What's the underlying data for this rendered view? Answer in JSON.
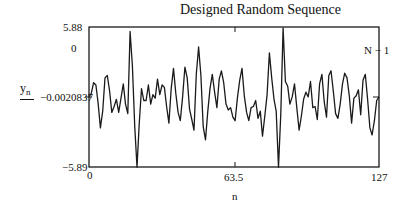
{
  "chart_data": {
    "type": "line",
    "title": "Designed Random Sequence",
    "xlabel": "n",
    "ylabel": "y_n",
    "xlim": [
      0,
      127
    ],
    "ylim": [
      -5.89,
      5.88
    ],
    "x_ticks": [
      "0",
      "63.5",
      "127"
    ],
    "y_ticks": [
      "5.88",
      "0",
      "-5.89"
    ],
    "annotations": {
      "y_marker_label": "-0.0020837",
      "y_marker_value": -0.0020837,
      "right_marker_label": "N - 1",
      "right_marker_value": 127
    },
    "grid": false,
    "legend": null,
    "series": [
      {
        "name": "y_n",
        "x": [
          0,
          1,
          2,
          3,
          4,
          5,
          6,
          7,
          8,
          9,
          10,
          11,
          12,
          13,
          14,
          15,
          16,
          17,
          18,
          19,
          20,
          21,
          22,
          23,
          24,
          25,
          26,
          27,
          28,
          29,
          30,
          31,
          32,
          33,
          34,
          35,
          36,
          37,
          38,
          39,
          40,
          41,
          42,
          43,
          44,
          45,
          46,
          47,
          48,
          49,
          50,
          51,
          52,
          53,
          54,
          55,
          56,
          57,
          58,
          59,
          60,
          61,
          62,
          63,
          64,
          65,
          66,
          67,
          68,
          69,
          70,
          71,
          72,
          73,
          74,
          75,
          76,
          77,
          78,
          79,
          80,
          81,
          82,
          83,
          84,
          85,
          86,
          87,
          88,
          89,
          90,
          91,
          92,
          93,
          94,
          95,
          96,
          97,
          98,
          99,
          100,
          101,
          102,
          103,
          104,
          105,
          106,
          107,
          108,
          109,
          110,
          111,
          112,
          113,
          114,
          115,
          116,
          117,
          118,
          119,
          120,
          121,
          122,
          123,
          124,
          125,
          126,
          127
        ],
        "values": [
          0.0,
          0.3,
          1.2,
          1.0,
          -0.5,
          -2.6,
          -1.2,
          1.6,
          1.8,
          0.5,
          -1.3,
          -0.8,
          -0.2,
          -1.3,
          -0.1,
          1.1,
          -0.6,
          -1.4,
          5.5,
          2.6,
          -2.4,
          -5.9,
          -2.3,
          0.7,
          -0.3,
          -0.3,
          1.0,
          -0.6,
          0.2,
          -0.1,
          1.5,
          0.2,
          1.0,
          0.8,
          -0.8,
          -2.2,
          0.7,
          2.4,
          0.3,
          -1.3,
          -2.0,
          0.0,
          2.5,
          1.6,
          -1.0,
          -1.9,
          -2.8,
          1.9,
          4.2,
          1.8,
          -2.5,
          -3.6,
          -1.3,
          0.7,
          1.9,
          0.4,
          -0.9,
          1.5,
          2.2,
          1.2,
          -0.6,
          -1.1,
          -0.9,
          -1.7,
          -2.0,
          -0.1,
          1.4,
          2.4,
          0.1,
          -1.3,
          -2.0,
          -0.9,
          -0.8,
          -0.3,
          -1.8,
          -1.2,
          -3.3,
          -1.6,
          0.2,
          3.7,
          1.6,
          -0.2,
          -1.2,
          -5.9,
          -1.4,
          5.8,
          1.3,
          0.9,
          -0.6,
          0.0,
          1.1,
          -0.9,
          -2.8,
          -1.6,
          -0.2,
          0.4,
          0.0,
          1.3,
          -0.9,
          -0.8,
          -1.9,
          1.1,
          1.9,
          -0.4,
          -1.7,
          1.8,
          2.2,
          0.5,
          -1.4,
          -1.8,
          -0.6,
          1.1,
          2.0,
          1.6,
          0.1,
          -2.2,
          -0.1,
          0.1,
          0.6,
          -1.5,
          1.4,
          1.9,
          -0.2,
          -2.6,
          -3.2,
          -2.0,
          -0.3,
          0.0
        ]
      }
    ]
  },
  "plot": {
    "title": "Designed Random Sequence",
    "x_axis_label": "n",
    "y_axis_label": "y",
    "y_axis_subscript": "n",
    "y_max_label": "5.88",
    "y_zero_label": "0",
    "y_min_label": "−5.89",
    "y_marker_label": "−0.0020837",
    "x_min_label": "0",
    "x_mid_label": "63.5",
    "x_max_label": "127",
    "right_marker_label": "N − 1",
    "line_color": "#1a1a1a",
    "frame_color": "#1a1a1a"
  }
}
